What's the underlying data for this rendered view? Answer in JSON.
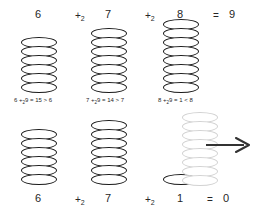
{
  "diagram": {
    "background_color": "#ffffff",
    "stroke_color": "#1a1a1a",
    "faded_stroke_color": "#d2d2d2",
    "rows": [
      {
        "id": "top-row",
        "position": "top",
        "labels_position": "above",
        "terms": [
          {
            "value": "6",
            "stack_count": 6,
            "faded": false
          },
          {
            "value": "7",
            "stack_count": 7,
            "faded": false
          },
          {
            "value": "8",
            "stack_count": 8,
            "faded": false
          }
        ],
        "operators": [
          "+",
          "+"
        ],
        "operator_subscript": "2",
        "equals_sign": "=",
        "result": "9",
        "formulas": [
          {
            "lhs": "6 +",
            "sub": "2",
            "rhs": "9 = 15 > 6"
          },
          {
            "lhs": "7 +",
            "sub": "2",
            "rhs": "9 = 14 > 7"
          },
          {
            "lhs": "8 +",
            "sub": "2",
            "rhs": "9 = 1 < 8"
          }
        ]
      },
      {
        "id": "bottom-row",
        "position": "bottom",
        "labels_position": "below",
        "terms": [
          {
            "value": "6",
            "stack_count": 6,
            "faded": false
          },
          {
            "value": "7",
            "stack_count": 7,
            "faded": false
          },
          {
            "value": "1",
            "stack_count": 1,
            "faded": false
          }
        ],
        "operators": [
          "+",
          "+"
        ],
        "operator_subscript": "2",
        "equals_sign": "=",
        "result": "0",
        "ghost_stack": {
          "stack_count": 8,
          "faded": true
        },
        "arrow": {
          "direction": "right",
          "color": "#333333"
        }
      }
    ]
  }
}
